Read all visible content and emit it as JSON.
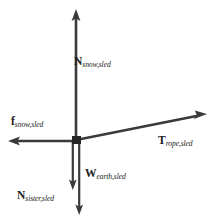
{
  "diagram": {
    "type": "free-body-diagram",
    "background_color": "#ffffff",
    "stroke_color": "#3a3a3a",
    "text_color": "#1c1c1c",
    "origin": {
      "x": 76,
      "y": 140
    },
    "vectors": [
      {
        "id": "normal-snow",
        "symbol": "N",
        "subscript": "snow,sled",
        "direction": "up",
        "from": {
          "x": 76,
          "y": 140
        },
        "to": {
          "x": 76,
          "y": 11
        },
        "label_position": "right-of-shaft"
      },
      {
        "id": "friction-snow",
        "symbol": "f",
        "subscript": "snow,sled",
        "direction": "left",
        "from": {
          "x": 76,
          "y": 141
        },
        "to": {
          "x": 9,
          "y": 141
        },
        "label_position": "above-shaft"
      },
      {
        "id": "tension-rope",
        "symbol": "T",
        "subscript": "rope,sled",
        "direction": "up-right",
        "from": {
          "x": 76,
          "y": 140
        },
        "to": {
          "x": 206,
          "y": 114
        },
        "label_position": "below-shaft"
      },
      {
        "id": "weight-earth",
        "symbol": "W",
        "subscript": "earth,sled",
        "direction": "down",
        "from": {
          "x": 73,
          "y": 140
        },
        "to": {
          "x": 73,
          "y": 189
        },
        "label_position": "right-of-shaft"
      },
      {
        "id": "normal-sister",
        "symbol": "N",
        "subscript": "sister,sled",
        "direction": "down",
        "from": {
          "x": 79,
          "y": 140
        },
        "to": {
          "x": 79,
          "y": 214
        },
        "label_position": "left-of-shaft"
      }
    ],
    "labels": {
      "normal_snow": {
        "symbol": "N",
        "subscript": "snow,sled"
      },
      "friction_snow": {
        "symbol": "f",
        "subscript": "snow,sled"
      },
      "tension_rope": {
        "symbol": "T",
        "subscript": "rope,sled"
      },
      "weight_earth": {
        "symbol": "W",
        "subscript": "earth,sled"
      },
      "normal_sister": {
        "symbol": "N",
        "subscript": "sister,sled"
      }
    }
  }
}
